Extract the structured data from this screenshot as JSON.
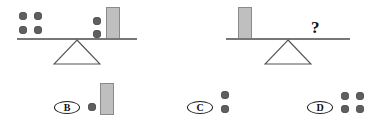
{
  "puzzle": {
    "type": "balance-scale-analogy",
    "question_mark": "?",
    "scales": [
      {
        "id": "given-scale",
        "state": "balanced",
        "left_pan": {
          "dots": 4,
          "bars": 0
        },
        "right_pan": {
          "dots": 2,
          "bars": 1
        }
      },
      {
        "id": "question-scale",
        "state": "balanced",
        "left_pan": {
          "dots": 0,
          "bars": 1
        },
        "right_pan": {
          "unknown": "?"
        }
      }
    ]
  },
  "options": [
    {
      "letter": "B",
      "dots": 1,
      "bars": 1
    },
    {
      "letter": "C",
      "dots": 2,
      "bars": 0
    },
    {
      "letter": "D",
      "dots": 4,
      "bars": 0
    }
  ],
  "colors": {
    "dot": "#5f5f5f",
    "bar_fill": "#bfbfbf",
    "bar_stroke": "#8a8a8a",
    "beam": "#777777",
    "ink": "#111111",
    "background": "#ffffff"
  }
}
